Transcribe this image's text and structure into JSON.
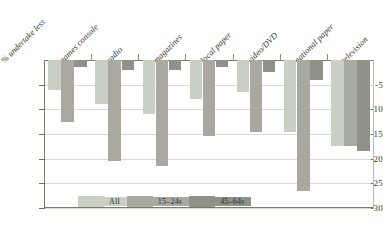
{
  "chart_data": {
    "type": "bar",
    "title": "",
    "subtitle": "",
    "xlabel": "",
    "ylabel": "% undertake less",
    "ylim": [
      -30,
      0
    ],
    "grid": true,
    "orientation": "vertical-negative",
    "legend_position": "bottom",
    "yticks": [
      -5,
      -10,
      -15,
      -20,
      -25,
      -30
    ],
    "ytick_labels": [
      "-5",
      "-10",
      "-15",
      "-20",
      "-25",
      "-30"
    ],
    "categories": [
      "games console",
      "radio",
      "magazines",
      "local paper",
      "video/DVD",
      "national paper",
      "television"
    ],
    "series": [
      {
        "name": "All",
        "color": "#c9cfc2",
        "values": [
          -6.0,
          -9.0,
          -11.0,
          -8.0,
          -6.5,
          -14.5,
          -17.5
        ]
      },
      {
        "name": "15-24s",
        "color": "#a9a9a1",
        "values": [
          -12.5,
          -20.5,
          -21.5,
          -15.5,
          -14.5,
          -26.5,
          -17.5
        ]
      },
      {
        "name": "45-64s",
        "color": "#8f9288",
        "values": [
          -1.5,
          -2.0,
          -2.0,
          -1.5,
          -2.5,
          -4.0,
          -18.5
        ]
      }
    ],
    "legend": [
      {
        "label": "All",
        "color": "#c9cfc2"
      },
      {
        "label": "15–24s",
        "color": "#a9a9a1"
      },
      {
        "label": "45–64s",
        "color": "#8f9288"
      }
    ],
    "axis_label_rotated": "% undertake less"
  }
}
